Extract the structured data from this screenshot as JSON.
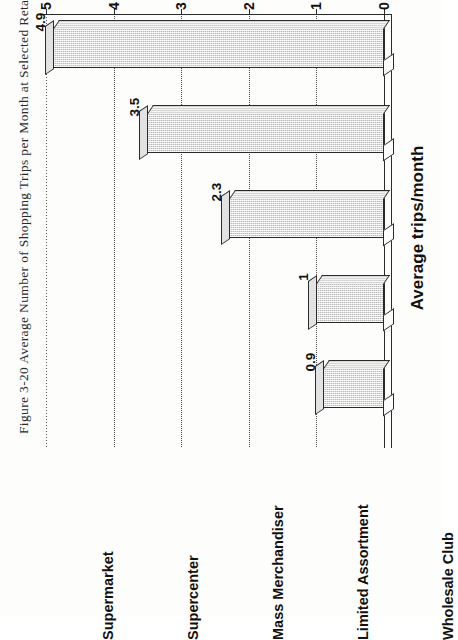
{
  "caption": "Figure 3-20 Average Number of Shopping Trips per Month at Selected Retail Formats",
  "chart_data": {
    "type": "bar",
    "title": "Average Number of Shopping Trips per Month at Selected Retail Formats",
    "categories": [
      "Supermarket",
      "Supercenter",
      "Mass Merchandiser",
      "Limited Assortment",
      "Wholesale Club"
    ],
    "values": [
      4.9,
      3.5,
      2.3,
      1,
      0.9
    ],
    "value_labels": [
      "4.9",
      "3.5",
      "2.3",
      "1",
      "0.9"
    ],
    "xlabel": "",
    "ylabel": "Average trips/month",
    "ylim": [
      0,
      5
    ],
    "yticks": [
      0,
      1,
      2,
      3,
      4,
      5
    ],
    "ytick_labels": [
      "0",
      "1",
      "2",
      "3",
      "4",
      "5"
    ],
    "grid": true,
    "legend": null,
    "orientation": "rotated-90-ccw",
    "style": "3d-column",
    "colors": {
      "bar_fill": "#b9b9b9",
      "bar_top": "#d7d7d7",
      "bar_edge": "#2b2b2b",
      "grid": "#4a4a4a",
      "background": "#ffffff"
    }
  }
}
